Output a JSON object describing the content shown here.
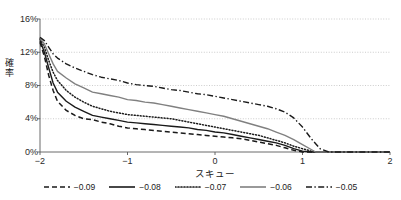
{
  "chart_data": {
    "type": "line",
    "title": "",
    "xlabel": "スキュー",
    "ylabel": "確率",
    "xlim": [
      -2,
      2
    ],
    "ylim": [
      0,
      0.16
    ],
    "grid": true,
    "grid_axis": "y",
    "legend_position": "bottom",
    "xticks": [
      "−2",
      "−1",
      "0",
      "1",
      "2"
    ],
    "xtick_values": [
      -2,
      -1,
      0,
      1,
      2
    ],
    "yticks": [
      "0%",
      "4%",
      "8%",
      "12%",
      "16%"
    ],
    "ytick_values": [
      0,
      0.04,
      0.08,
      0.12,
      0.16
    ],
    "series": [
      {
        "name": "−0.09",
        "style": "dashed",
        "color": "#1a1a1a",
        "x": [
          -2.0,
          -1.95,
          -1.9,
          -1.85,
          -1.8,
          -1.7,
          -1.6,
          -1.5,
          -1.4,
          -1.3,
          -1.2,
          -1.1,
          -1.0,
          -0.9,
          -0.8,
          -0.7,
          -0.6,
          -0.5,
          -0.4,
          -0.3,
          -0.2,
          -0.1,
          0.0,
          0.1,
          0.2,
          0.3,
          0.4,
          0.5,
          0.6,
          0.7,
          0.8,
          0.9,
          1.0,
          1.1,
          1.2,
          1.3,
          1.5,
          2.0
        ],
        "y": [
          0.132,
          0.115,
          0.092,
          0.074,
          0.061,
          0.05,
          0.044,
          0.04,
          0.039,
          0.036,
          0.034,
          0.031,
          0.029,
          0.028,
          0.027,
          0.026,
          0.025,
          0.024,
          0.023,
          0.022,
          0.021,
          0.02,
          0.019,
          0.018,
          0.017,
          0.016,
          0.014,
          0.012,
          0.01,
          0.008,
          0.005,
          0.002,
          0.0,
          0.0,
          0.0,
          0.0,
          0.0,
          0.0
        ]
      },
      {
        "name": "−0.08",
        "style": "solid",
        "color": "#1a1a1a",
        "x": [
          -2.0,
          -1.95,
          -1.9,
          -1.85,
          -1.8,
          -1.7,
          -1.6,
          -1.5,
          -1.4,
          -1.3,
          -1.2,
          -1.1,
          -1.0,
          -0.9,
          -0.8,
          -0.7,
          -0.6,
          -0.5,
          -0.4,
          -0.3,
          -0.2,
          -0.1,
          0.0,
          0.1,
          0.2,
          0.3,
          0.4,
          0.5,
          0.6,
          0.7,
          0.8,
          0.9,
          1.0,
          1.1,
          1.2,
          1.3,
          1.5,
          2.0
        ],
        "y": [
          0.134,
          0.12,
          0.101,
          0.083,
          0.072,
          0.061,
          0.054,
          0.049,
          0.044,
          0.042,
          0.04,
          0.038,
          0.036,
          0.035,
          0.034,
          0.033,
          0.032,
          0.031,
          0.03,
          0.029,
          0.027,
          0.026,
          0.024,
          0.023,
          0.021,
          0.019,
          0.017,
          0.015,
          0.013,
          0.011,
          0.008,
          0.004,
          0.001,
          0.0,
          0.0,
          0.0,
          0.0,
          0.0
        ]
      },
      {
        "name": "−0.07",
        "style": "dotted",
        "color": "#1a1a1a",
        "x": [
          -2.0,
          -1.95,
          -1.9,
          -1.85,
          -1.8,
          -1.7,
          -1.6,
          -1.5,
          -1.4,
          -1.3,
          -1.2,
          -1.1,
          -1.0,
          -0.9,
          -0.8,
          -0.7,
          -0.6,
          -0.5,
          -0.4,
          -0.3,
          -0.2,
          -0.1,
          0.0,
          0.1,
          0.2,
          0.3,
          0.4,
          0.5,
          0.6,
          0.7,
          0.8,
          0.9,
          1.0,
          1.1,
          1.15,
          1.2,
          1.5,
          2.0
        ],
        "y": [
          0.136,
          0.126,
          0.11,
          0.096,
          0.086,
          0.074,
          0.066,
          0.06,
          0.055,
          0.052,
          0.049,
          0.047,
          0.045,
          0.044,
          0.043,
          0.042,
          0.041,
          0.04,
          0.038,
          0.036,
          0.034,
          0.032,
          0.03,
          0.028,
          0.026,
          0.024,
          0.022,
          0.02,
          0.017,
          0.014,
          0.011,
          0.007,
          0.004,
          0.001,
          0.0,
          0.0,
          0.0,
          0.0
        ]
      },
      {
        "name": "−0.06",
        "style": "solid",
        "color": "#808080",
        "x": [
          -2.0,
          -1.95,
          -1.9,
          -1.85,
          -1.8,
          -1.7,
          -1.6,
          -1.5,
          -1.4,
          -1.3,
          -1.2,
          -1.1,
          -1.0,
          -0.9,
          -0.8,
          -0.7,
          -0.6,
          -0.5,
          -0.4,
          -0.3,
          -0.2,
          -0.1,
          0.0,
          0.1,
          0.2,
          0.3,
          0.4,
          0.5,
          0.6,
          0.7,
          0.8,
          0.9,
          1.0,
          1.1,
          1.15,
          1.2,
          1.5,
          2.0
        ],
        "y": [
          0.137,
          0.13,
          0.118,
          0.106,
          0.097,
          0.089,
          0.082,
          0.077,
          0.072,
          0.07,
          0.068,
          0.066,
          0.063,
          0.062,
          0.06,
          0.059,
          0.057,
          0.055,
          0.053,
          0.051,
          0.049,
          0.047,
          0.045,
          0.043,
          0.04,
          0.037,
          0.034,
          0.031,
          0.028,
          0.024,
          0.02,
          0.015,
          0.009,
          0.003,
          0.0,
          0.0,
          0.0,
          0.0
        ]
      },
      {
        "name": "−0.05",
        "style": "dashdot",
        "color": "#1a1a1a",
        "x": [
          -2.0,
          -1.95,
          -1.9,
          -1.85,
          -1.8,
          -1.7,
          -1.6,
          -1.5,
          -1.4,
          -1.3,
          -1.2,
          -1.1,
          -1.0,
          -0.9,
          -0.8,
          -0.7,
          -0.6,
          -0.5,
          -0.4,
          -0.3,
          -0.2,
          -0.1,
          0.0,
          0.1,
          0.2,
          0.3,
          0.4,
          0.5,
          0.6,
          0.7,
          0.8,
          0.9,
          1.0,
          1.1,
          1.2,
          1.3,
          1.5,
          2.0
        ],
        "y": [
          0.138,
          0.134,
          0.126,
          0.118,
          0.113,
          0.106,
          0.101,
          0.097,
          0.093,
          0.09,
          0.088,
          0.086,
          0.083,
          0.081,
          0.08,
          0.079,
          0.077,
          0.075,
          0.074,
          0.072,
          0.07,
          0.069,
          0.067,
          0.065,
          0.063,
          0.061,
          0.059,
          0.057,
          0.055,
          0.052,
          0.048,
          0.041,
          0.03,
          0.016,
          0.004,
          0.0,
          0.0,
          0.0
        ]
      }
    ],
    "legend": [
      {
        "label": "−0.09",
        "style": "dashed",
        "color": "#1a1a1a"
      },
      {
        "label": "−0.08",
        "style": "solid",
        "color": "#1a1a1a"
      },
      {
        "label": "−0.07",
        "style": "dotted",
        "color": "#1a1a1a"
      },
      {
        "label": "−0.06",
        "style": "solid",
        "color": "#808080"
      },
      {
        "label": "−0.05",
        "style": "dashdot",
        "color": "#1a1a1a"
      }
    ],
    "colors": {
      "axis": "#595959",
      "grid": "#bfbfbf",
      "text": "#1a1a1a",
      "gray_series": "#808080"
    }
  }
}
